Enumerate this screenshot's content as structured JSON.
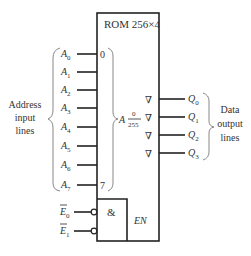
{
  "diagram": {
    "title": "ROM 256×4",
    "address_label_lines": [
      "Address",
      "input",
      "lines"
    ],
    "data_label_lines": [
      "Data",
      "output",
      "lines"
    ],
    "address_range_start": "0",
    "address_range_end": "7",
    "address_symbol": "A",
    "address_fraction_top": "0",
    "address_fraction_bottom": "255",
    "inputs": [
      {
        "name": "A",
        "sub": "0",
        "y": 54
      },
      {
        "name": "A",
        "sub": "1",
        "y": 72
      },
      {
        "name": "A",
        "sub": "2",
        "y": 90
      },
      {
        "name": "A",
        "sub": "3",
        "y": 108
      },
      {
        "name": "A",
        "sub": "4",
        "y": 127
      },
      {
        "name": "A",
        "sub": "5",
        "y": 146
      },
      {
        "name": "A",
        "sub": "6",
        "y": 165
      },
      {
        "name": "A",
        "sub": "7",
        "y": 185
      }
    ],
    "outputs": [
      {
        "name": "Q",
        "sub": "0",
        "y": 99
      },
      {
        "name": "Q",
        "sub": "1",
        "y": 117
      },
      {
        "name": "Q",
        "sub": "2",
        "y": 135
      },
      {
        "name": "Q",
        "sub": "3",
        "y": 153
      }
    ],
    "output_symbol": "∇",
    "enables": [
      {
        "name": "E",
        "sub": "0",
        "y": 212
      },
      {
        "name": "E",
        "sub": "1",
        "y": 231
      }
    ],
    "and_symbol": "&",
    "enable_label": "EN"
  }
}
